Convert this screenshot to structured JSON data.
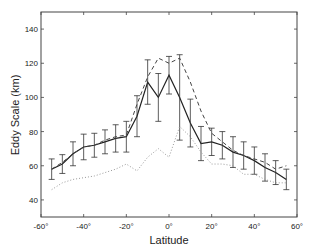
{
  "chart_data": {
    "type": "line",
    "title": "",
    "xlabel": "Latitude",
    "ylabel": "Eddy Scale  (km)",
    "xlim": [
      -60,
      60
    ],
    "ylim": [
      30,
      150
    ],
    "xticks": [
      -60,
      -40,
      -20,
      0,
      20,
      40,
      60
    ],
    "xtick_labels": [
      "-60°",
      "-40°",
      "-20°",
      "0°",
      "20°",
      "40°",
      "60°"
    ],
    "yticks": [
      40,
      60,
      80,
      100,
      120,
      140
    ],
    "ytick_labels": [
      "40",
      "60",
      "80",
      "100",
      "120",
      "140"
    ],
    "grid": false,
    "legend": null,
    "x": [
      -55,
      -50,
      -45,
      -40,
      -35,
      -30,
      -25,
      -20,
      -15,
      -10,
      -5,
      0,
      5,
      10,
      15,
      20,
      25,
      30,
      35,
      40,
      45,
      50,
      55
    ],
    "series": [
      {
        "name": "mean (solid, with error bars)",
        "style": "solid",
        "values": [
          58,
          61,
          67,
          71,
          72,
          74,
          76,
          77,
          89,
          109,
          100,
          113,
          100,
          85,
          73,
          74,
          72,
          68,
          66,
          63,
          59,
          56,
          52
        ],
        "error": [
          6,
          5.5,
          7,
          7.5,
          7,
          7,
          8,
          9,
          12,
          13,
          14,
          11,
          25,
          14,
          10,
          8,
          8,
          9,
          8,
          8,
          8,
          7,
          6
        ]
      },
      {
        "name": "dashed",
        "style": "dashed",
        "values": [
          58,
          62,
          67,
          71,
          72,
          75,
          77,
          78,
          96,
          112,
          123,
          120,
          123,
          109,
          92,
          79,
          74,
          69,
          66,
          64,
          62,
          58,
          60
        ]
      },
      {
        "name": "dotted",
        "style": "dotted",
        "values": [
          46,
          50,
          52,
          53,
          54,
          56,
          58,
          61,
          57,
          65,
          70,
          65,
          83,
          77,
          68,
          61,
          61,
          60,
          55,
          55,
          52,
          50,
          50
        ]
      }
    ]
  }
}
